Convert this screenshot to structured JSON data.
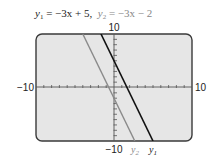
{
  "title": {
    "eq1_var": "y",
    "eq1_sub": "1",
    "eq1_rhs": " = −3x + 5,",
    "eq2_var": "y",
    "eq2_sub": "2",
    "eq2_rhs": " = −3x − 2"
  },
  "axis_labels": {
    "y_max": "10",
    "y_min": "−10",
    "x_min": "−10",
    "x_max": "10"
  },
  "series_labels": {
    "y2": "y",
    "y2_sub": "2",
    "y1": "y",
    "y1_sub": "1"
  },
  "colors": {
    "screen_bg": "#e6e6e6",
    "frame": "#3a3a3a",
    "y1_line": "#111111",
    "y2_line": "#8a8a8a"
  },
  "chart_data": {
    "type": "line",
    "xlabel": "",
    "ylabel": "",
    "xlim": [
      -10,
      10
    ],
    "ylim": [
      -10,
      10
    ],
    "x_tick_step": 1,
    "y_tick_step": 1,
    "grid": false,
    "legend": "inline labels at bottom of lines",
    "series": [
      {
        "name": "y1",
        "equation": "y = -3x + 5",
        "slope": -3,
        "intercept": 5,
        "x": [
          -1.667,
          5
        ],
        "y": [
          10,
          -10
        ],
        "color": "#111111"
      },
      {
        "name": "y2",
        "equation": "y = -3x - 2",
        "slope": -3,
        "intercept": -2,
        "x": [
          -4,
          2.667
        ],
        "y": [
          10,
          -10
        ],
        "color": "#8a8a8a"
      }
    ]
  }
}
